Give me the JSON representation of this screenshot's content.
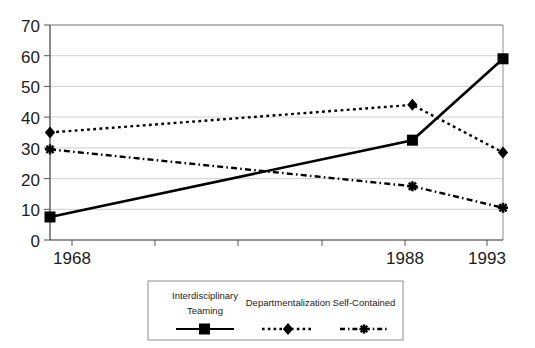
{
  "chart_data": {
    "type": "line",
    "title": "",
    "subtitle": "",
    "xlabel": "",
    "ylabel": "",
    "categories": [
      "1968",
      "1988",
      "1993"
    ],
    "x": [
      1968,
      1988,
      1993
    ],
    "xlim": [
      1968,
      1993
    ],
    "ylim": [
      0,
      70
    ],
    "y_ticks": [
      0,
      10,
      20,
      30,
      40,
      50,
      60,
      70
    ],
    "x_ticks": [
      "1968",
      "1988",
      "1993"
    ],
    "grid": true,
    "legend_position": "bottom",
    "series": [
      {
        "name": "Interdisciplinary Teaming",
        "values": [
          7.5,
          32.5,
          59
        ],
        "line_style": "solid",
        "marker": "square",
        "color": "#000000"
      },
      {
        "name": "Departmentalization",
        "values": [
          35,
          44,
          28.5
        ],
        "line_style": "dotted",
        "marker": "diamond",
        "color": "#000000"
      },
      {
        "name": "Self-Contained",
        "values": [
          29.5,
          17.5,
          10.5
        ],
        "line_style": "dash-dot",
        "marker": "star",
        "color": "#000000"
      }
    ]
  },
  "axes": {
    "y_tick_labels": [
      "70",
      "60",
      "50",
      "40",
      "30",
      "20",
      "10",
      "0"
    ],
    "x_tick_labels": [
      "1968",
      "1988",
      "1993"
    ]
  },
  "legend": {
    "items": [
      {
        "label_line1": "Interdisciplinary",
        "label_line2": "Teaming"
      },
      {
        "label_line1": "Departmentalization",
        "label_line2": ""
      },
      {
        "label_line1": "Self-Contained",
        "label_line2": ""
      }
    ]
  },
  "colors": {
    "ink": "#000000",
    "grid": "#c9c9c9",
    "frame": "#8b8b8b",
    "background": "#ffffff"
  }
}
